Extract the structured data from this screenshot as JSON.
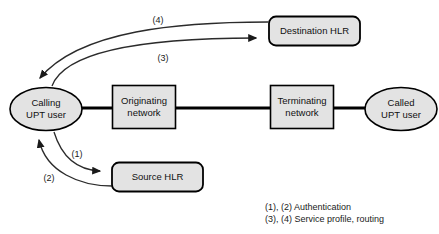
{
  "diagram": {
    "colors": {
      "shape_fill": "#e3e3e3",
      "shape_stroke": "#000000",
      "line": "#000000",
      "curve": "#2b2b2b",
      "text": "#1a1a1a",
      "background": "#ffffff"
    },
    "nodes": [
      {
        "id": "calling-upt-user",
        "shape": "ellipse",
        "line1": "Calling",
        "line2": "UPT user"
      },
      {
        "id": "originating-network",
        "shape": "rect",
        "line1": "Originating",
        "line2": "network"
      },
      {
        "id": "terminating-network",
        "shape": "rect",
        "line1": "Terminating",
        "line2": "network"
      },
      {
        "id": "called-upt-user",
        "shape": "ellipse",
        "line1": "Called",
        "line2": "UPT user"
      },
      {
        "id": "destination-hlr",
        "shape": "rounded-rect",
        "line1": "Destination HLR",
        "line2": ""
      },
      {
        "id": "source-hlr",
        "shape": "rounded-rect",
        "line1": "Source HLR",
        "line2": ""
      }
    ],
    "arrow_labels": [
      {
        "id": "label-4",
        "text": "(4)"
      },
      {
        "id": "label-3",
        "text": "(3)"
      },
      {
        "id": "label-1",
        "text": "(1)"
      },
      {
        "id": "label-2",
        "text": "(2)"
      }
    ],
    "legend": [
      {
        "id": "legend-auth",
        "text": "(1), (2) Authentication"
      },
      {
        "id": "legend-profile",
        "text": "(3), (4) Service profile, routing"
      }
    ]
  }
}
